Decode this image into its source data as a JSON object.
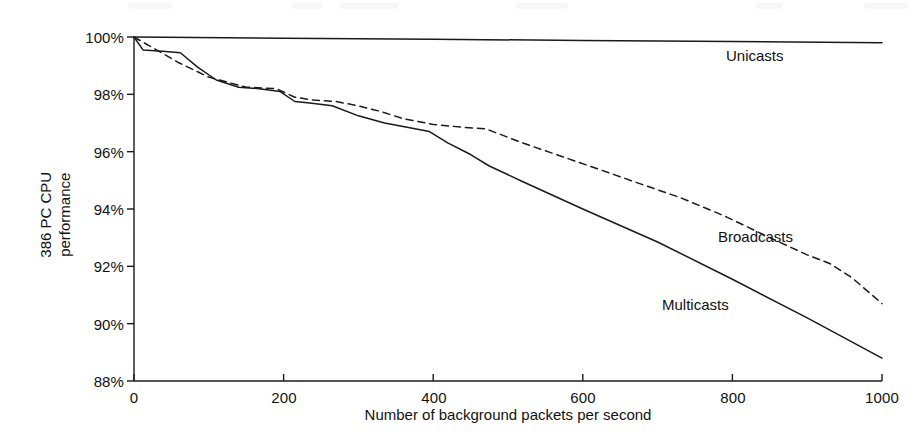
{
  "chart_data": {
    "type": "line",
    "title": "",
    "xlabel": "Number of background packets per second",
    "ylabel": "386 PC CPU performance",
    "ylabel_line1": "386 PC CPU",
    "ylabel_line2": "performance",
    "xlim": [
      0,
      1000
    ],
    "ylim": [
      88,
      100
    ],
    "xticks": [
      0,
      200,
      400,
      600,
      800,
      1000
    ],
    "xtick_labels": [
      "0",
      "200",
      "400",
      "600",
      "800",
      "1000"
    ],
    "yticks": [
      88,
      90,
      92,
      94,
      96,
      98,
      100
    ],
    "ytick_labels": [
      "88%",
      "90%",
      "92%",
      "94%",
      "96%",
      "98%",
      "100%"
    ],
    "grid": false,
    "legend_position": "inline-right-annotations",
    "y_unit": "percent",
    "series": [
      {
        "name": "Unicasts",
        "style": "solid",
        "color": "#1a1a1a",
        "label_x": 790,
        "label_y": 99.9,
        "x": [
          0,
          200,
          400,
          600,
          800,
          1000
        ],
        "values": [
          100.0,
          99.96,
          99.92,
          99.88,
          99.84,
          99.8
        ]
      },
      {
        "name": "Broadcasts",
        "style": "dashed",
        "color": "#1a1a1a",
        "label_x": 790,
        "label_y": 93.7,
        "x": [
          0,
          20,
          60,
          100,
          150,
          190,
          215,
          240,
          270,
          300,
          330,
          360,
          400,
          440,
          470,
          520,
          570,
          620,
          680,
          730,
          790,
          850,
          900,
          930,
          960,
          1000
        ],
        "values": [
          100.0,
          99.7,
          99.1,
          98.6,
          98.25,
          98.2,
          97.9,
          97.8,
          97.75,
          97.6,
          97.4,
          97.15,
          96.95,
          96.85,
          96.8,
          96.3,
          95.85,
          95.4,
          94.85,
          94.4,
          93.75,
          93.0,
          92.4,
          92.1,
          91.6,
          90.7
        ]
      },
      {
        "name": "Multicasts",
        "style": "solid",
        "color": "#1a1a1a",
        "label_x": 700,
        "label_y": 90.9,
        "x": [
          0,
          12,
          38,
          62,
          85,
          110,
          140,
          165,
          195,
          215,
          235,
          265,
          300,
          335,
          365,
          395,
          420,
          450,
          475,
          520,
          600,
          700,
          800,
          900,
          1000
        ],
        "values": [
          100.0,
          99.55,
          99.5,
          99.45,
          98.95,
          98.5,
          98.25,
          98.2,
          98.1,
          97.75,
          97.7,
          97.6,
          97.25,
          97.0,
          96.85,
          96.7,
          96.3,
          95.9,
          95.5,
          94.95,
          94.0,
          92.85,
          91.55,
          90.2,
          88.8
        ]
      }
    ]
  },
  "geometry": {
    "plot_left": 134,
    "plot_right": 882,
    "plot_top": 37,
    "plot_bottom": 381
  }
}
